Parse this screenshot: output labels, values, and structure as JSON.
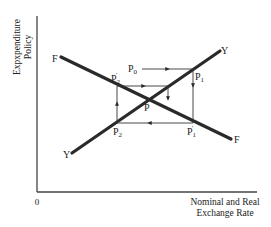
{
  "diagram": {
    "axes": {
      "y_label_line1": "Expxpenditure",
      "y_label_line2": "Policy",
      "x_label_line1": "Nominal and Real",
      "x_label_line2": "Exchange Rate",
      "origin": "0"
    },
    "curves": [
      {
        "id": "F",
        "start_label": "F",
        "end_label": "F",
        "slope": "downward"
      },
      {
        "id": "Y",
        "start_label": "Y",
        "end_label": "Y",
        "slope": "upward"
      }
    ],
    "points": {
      "equilibrium": {
        "base": "P",
        "sub": "",
        "prime": ""
      },
      "p0": {
        "base": "P",
        "sub": "0",
        "prime": ""
      },
      "p1": {
        "base": "P",
        "sub": "1",
        "prime": ""
      },
      "p1_prime": {
        "base": "P",
        "sub": "1",
        "prime": "'"
      },
      "p2": {
        "base": "P",
        "sub": "2",
        "prime": ""
      },
      "p2_prime": {
        "base": "P",
        "sub": "2",
        "prime": "'"
      }
    },
    "adjustment_path": [
      "P0",
      "P1",
      "P1'",
      "P2",
      "P2'",
      "P"
    ]
  }
}
